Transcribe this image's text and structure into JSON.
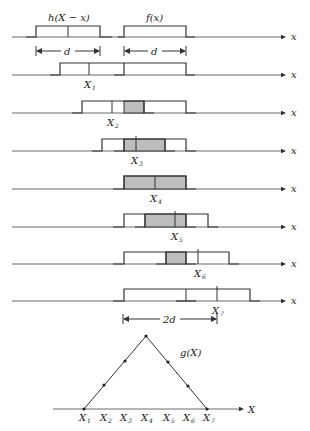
{
  "labels": {
    "h_pulse": "h(X − x)",
    "f_pulse": "f(x)",
    "d1": "d",
    "d2": "d",
    "two_d": "2d",
    "g_curve": "g(X)",
    "axis_x": "x",
    "axis_X": "X"
  },
  "rows": [
    {
      "shift_label": "",
      "sub": ""
    },
    {
      "shift_label": "X",
      "sub": "1"
    },
    {
      "shift_label": "X",
      "sub": "2"
    },
    {
      "shift_label": "X",
      "sub": "3"
    },
    {
      "shift_label": "X",
      "sub": "4"
    },
    {
      "shift_label": "X",
      "sub": "5"
    },
    {
      "shift_label": "X",
      "sub": "6"
    },
    {
      "shift_label": "X",
      "sub": "7"
    }
  ],
  "triangle_ticks": [
    {
      "label": "X",
      "sub": "1"
    },
    {
      "label": "X",
      "sub": "2"
    },
    {
      "label": "X",
      "sub": "3"
    },
    {
      "label": "X",
      "sub": "4"
    },
    {
      "label": "X",
      "sub": "5"
    },
    {
      "label": "X",
      "sub": "6"
    },
    {
      "label": "X",
      "sub": "7"
    }
  ]
}
